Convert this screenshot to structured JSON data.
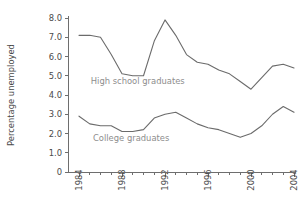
{
  "chart_data": {
    "type": "line",
    "title": "",
    "xlabel": "",
    "ylabel": "Percentage unemployed",
    "xlim": [
      1984,
      2004
    ],
    "ylim": [
      0,
      8
    ],
    "grid": false,
    "legend_position": "inline-labels",
    "x": [
      1984,
      1985,
      1986,
      1987,
      1988,
      1989,
      1990,
      1991,
      1992,
      1993,
      1994,
      1995,
      1996,
      1997,
      1998,
      1999,
      2000,
      2001,
      2002,
      2003,
      2004
    ],
    "xtick_labels": [
      "1984",
      "1988",
      "1992",
      "1996",
      "2000",
      "2004"
    ],
    "xtick_label_values": [
      1984,
      1988,
      1992,
      1996,
      2000,
      2004
    ],
    "xtick_minor_values": [
      1985,
      1986,
      1987,
      1989,
      1990,
      1991,
      1993,
      1994,
      1995,
      1997,
      1998,
      1999,
      2001,
      2002,
      2003
    ],
    "ytick_labels": [
      "0",
      "1.0",
      "2.0",
      "3.0",
      "4.0",
      "5.0",
      "6.0",
      "7.0",
      "8.0"
    ],
    "ytick_values": [
      0,
      1,
      2,
      3,
      4,
      5,
      6,
      7,
      8
    ],
    "series": [
      {
        "name": "High school graduates",
        "label_x": 1985.1,
        "label_y": 4.55,
        "values": [
          7.1,
          7.1,
          7.0,
          6.1,
          5.1,
          5.0,
          5.0,
          6.8,
          7.9,
          7.1,
          6.1,
          5.7,
          5.6,
          5.3,
          5.1,
          4.7,
          4.3,
          4.9,
          5.5,
          5.6,
          5.4
        ]
      },
      {
        "name": "College graduates",
        "label_x": 1985.3,
        "label_y": 1.62,
        "values": [
          2.9,
          2.5,
          2.4,
          2.4,
          2.1,
          2.1,
          2.2,
          2.8,
          3.0,
          3.1,
          2.8,
          2.5,
          2.3,
          2.2,
          2.0,
          1.8,
          2.0,
          2.4,
          3.0,
          3.4,
          3.1
        ]
      }
    ]
  },
  "colors": {
    "line": "#6b6b6b",
    "axis": "#6e6e6e",
    "tick_text": "#4a4a4a",
    "series_label": "#8d8d8d",
    "background": "#ffffff"
  }
}
